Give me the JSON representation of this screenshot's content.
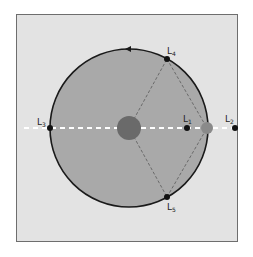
{
  "diagram": {
    "type": "lagrange-points",
    "colors": {
      "background": "#e3e3e3",
      "frame_border": "#6e6e6e",
      "orbit_fill": "#a9a9a9",
      "orbit_stroke": "#1a1a1a",
      "axis_line": "#ffffff",
      "triangle_lines": "#6a6a6a",
      "point": "#111111"
    },
    "bodies": {
      "primary": {
        "name": "sun",
        "cx": 129,
        "cy": 128,
        "r": 12
      },
      "secondary": {
        "name": "earth",
        "cx": 207,
        "cy": 128,
        "r": 6
      }
    },
    "orbit": {
      "cx": 129,
      "cy": 128,
      "r": 79
    },
    "points": [
      {
        "id": "L1",
        "label": "L",
        "sub": "1",
        "cx": 187,
        "cy": 128,
        "lx": 183,
        "ly": 122
      },
      {
        "id": "L2",
        "label": "L",
        "sub": "2",
        "cx": 235,
        "cy": 128,
        "lx": 225,
        "ly": 122
      },
      {
        "id": "L3",
        "label": "L",
        "sub": "3",
        "cx": 50,
        "cy": 128,
        "lx": 37,
        "ly": 125
      },
      {
        "id": "L4",
        "label": "L",
        "sub": "4",
        "cx": 167,
        "cy": 59,
        "lx": 167,
        "ly": 54
      },
      {
        "id": "L5",
        "label": "L",
        "sub": "5",
        "cx": 167,
        "cy": 197,
        "lx": 167,
        "ly": 210
      }
    ]
  }
}
